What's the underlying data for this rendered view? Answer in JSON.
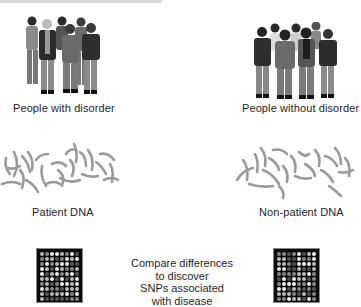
{
  "diagram": {
    "left": {
      "group_label": "People with disorder",
      "dna_label": "Patient DNA",
      "people_count": 6
    },
    "right": {
      "group_label": "People without disorder",
      "dna_label": "Non-patient DNA",
      "people_count": 7
    },
    "center": {
      "lines": [
        "Compare differences",
        "to discover",
        "SNPs associated",
        "with disease"
      ]
    },
    "microarray": {
      "columns": 8,
      "rows": 10,
      "background": "#0a0a0a",
      "dot_colors": [
        "#eeeeee",
        "#bbbbbb",
        "#888888",
        "#555555"
      ]
    },
    "icons": [
      "people-group-icon",
      "dna-strands-icon",
      "microarray-chip-icon"
    ]
  }
}
